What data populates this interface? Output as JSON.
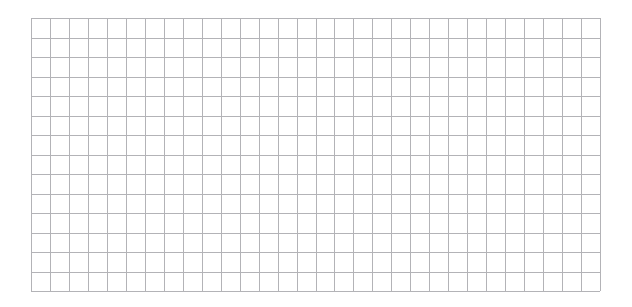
{
  "figure": {
    "background_color": "#ffffff",
    "width": 632,
    "height": 307
  },
  "chart_data": {
    "type": "line",
    "title": "",
    "subtitle": "",
    "xlabel": "",
    "ylabel": "",
    "categories": [],
    "x": [],
    "values": [],
    "series": [],
    "legend": [],
    "legend_position": "none",
    "annotations": [],
    "xtick_labels": [],
    "ytick_labels": [],
    "xlim": [
      0,
      30
    ],
    "ylim": [
      0,
      14
    ],
    "grid": true,
    "grid_color": "#b3b3b7",
    "grid_line_width": 1,
    "grid_columns": 30,
    "grid_rows": 14,
    "plot_area": {
      "left": 31,
      "top": 18,
      "width": 569,
      "height": 273
    },
    "note": "Empty graph-paper style plot canvas: grid only, no plotted data, no axis tick labels, no title or legend."
  }
}
